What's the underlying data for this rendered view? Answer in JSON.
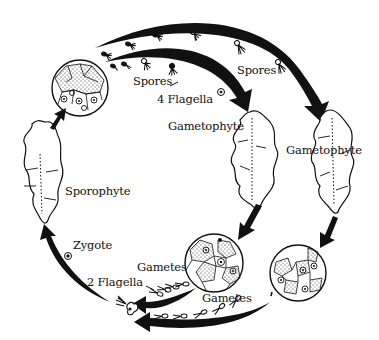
{
  "title": "",
  "labels": {
    "spores_left": "Spores",
    "flagella_4": "4 Flagella",
    "spores_right": "Spores",
    "gametophyte_center": "Gametophyte",
    "gametophyte_right": "Gametophyte",
    "sporophyte": "Sporophyte",
    "zygote": "Zygote",
    "gametes_left": "Gametes",
    "flagella_2": "2 Flagella",
    "gametes_bottom": "Gametes"
  },
  "stages": [
    {
      "id": "sporangium",
      "kind": "cell-cluster"
    },
    {
      "id": "gametophyte-1",
      "kind": "thallus"
    },
    {
      "id": "gametophyte-2",
      "kind": "thallus"
    },
    {
      "id": "gametangium-1",
      "kind": "cell-cluster"
    },
    {
      "id": "gametangium-2",
      "kind": "cell-cluster"
    },
    {
      "id": "zygote",
      "kind": "cell"
    },
    {
      "id": "sporophyte",
      "kind": "thallus"
    }
  ],
  "colors": {
    "ink": "#111111",
    "paper": "#ffffff"
  }
}
